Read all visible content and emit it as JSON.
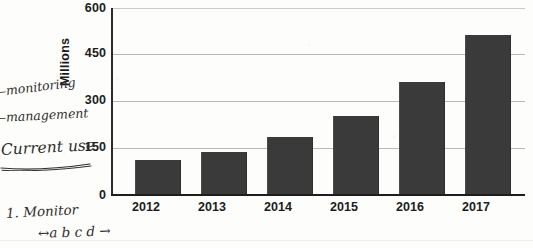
{
  "chart_data": {
    "type": "bar",
    "title": "",
    "xlabel": "",
    "ylabel": "Millions",
    "categories": [
      "2012",
      "2013",
      "2014",
      "2015",
      "2016",
      "2017"
    ],
    "values": [
      110,
      137,
      183,
      252,
      360,
      513
    ],
    "ylim": [
      0,
      600
    ],
    "yticks": [
      0,
      150,
      300,
      450,
      600
    ],
    "ytick_labels": [
      "0",
      "150",
      "300",
      "450",
      "600"
    ],
    "grid": true,
    "legend": "none",
    "bar_color": "#3a3a3a",
    "gridline_color": "#b9b9b9",
    "axis_color": "#1e1e1e",
    "background_color": "#fdfdfc"
  },
  "annotations": {
    "monitoring": "‒monitoring",
    "management": "‒management",
    "current_use": "Current use",
    "list_item": "1. Monitor",
    "sub_item": "↔a b c d →"
  },
  "icons": {
    "underline_stroke": "handwritten-underline",
    "arrow": "right-arrow"
  }
}
